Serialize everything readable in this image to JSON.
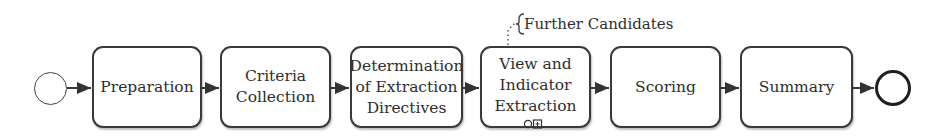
{
  "diagram": {
    "type": "bpmn-process",
    "start_event": {
      "label": ""
    },
    "end_event": {
      "label": ""
    },
    "tasks": [
      {
        "id": "preparation",
        "label": "Preparation"
      },
      {
        "id": "criteria-collection",
        "label": "Criteria\nCollection"
      },
      {
        "id": "determination",
        "label": "Determination\nof Extraction\nDirectives"
      },
      {
        "id": "view-indicator-extraction",
        "label": "View and\nIndicator\nExtraction",
        "markers": [
          "ad-hoc-loop-icon",
          "subprocess-plus-icon"
        ]
      },
      {
        "id": "scoring",
        "label": "Scoring"
      },
      {
        "id": "summary",
        "label": "Summary"
      }
    ],
    "annotation": {
      "attached_to": "view-indicator-extraction",
      "text": "Further Candidates"
    },
    "colors": {
      "stroke": "#3a3a3a",
      "fill": "#ffffff",
      "text": "#2e2e2e"
    }
  }
}
